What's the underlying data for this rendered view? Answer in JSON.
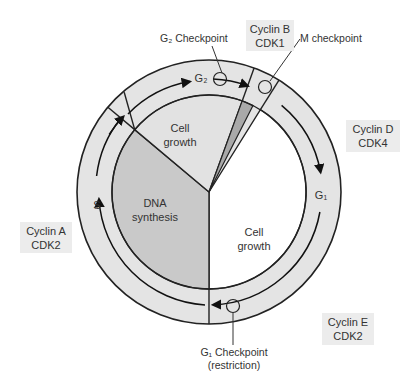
{
  "diagram": {
    "type": "cell-cycle",
    "phases": [
      {
        "id": "G1",
        "label": "G₁",
        "inner_label_line1": "Cell",
        "inner_label_line2": "growth",
        "fill": "#ffffff"
      },
      {
        "id": "S",
        "label": "S",
        "inner_label_line1": "DNA",
        "inner_label_line2": "synthesis",
        "fill": "#c9c9c9"
      },
      {
        "id": "G2",
        "label": "G₂",
        "inner_label_line1": "Cell",
        "inner_label_line2": "growth",
        "fill": "#e2e2e2"
      },
      {
        "id": "M",
        "label": "",
        "fill": "#a9a9a9"
      }
    ],
    "checkpoints": {
      "g2": "G₂ Checkpoint",
      "m": "M checkpoint",
      "g1_line1": "G₁ Checkpoint",
      "g1_line2": "(restriction)"
    },
    "cyclins": {
      "b": {
        "line1": "Cyclin B",
        "line2": "CDK1"
      },
      "d": {
        "line1": "Cyclin D",
        "line2": "CDK4"
      },
      "a": {
        "line1": "Cyclin A",
        "line2": "CDK2"
      },
      "e": {
        "line1": "Cyclin E",
        "line2": "CDK2"
      }
    },
    "colors": {
      "ring": "#e4e4e4",
      "stroke": "#222222",
      "box": "#ececec"
    }
  }
}
